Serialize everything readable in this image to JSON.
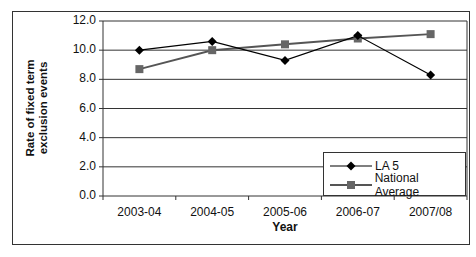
{
  "chart_data": {
    "type": "line",
    "title": "",
    "xlabel": "Year",
    "ylabel": "Rate of fixed term exclusion events",
    "ylabel_lines": [
      "Rate of fixed term",
      "exclusion events"
    ],
    "categories": [
      "2003-04",
      "2004-05",
      "2005-06",
      "2006-07",
      "2007/08"
    ],
    "series": [
      {
        "name": "LA 5",
        "marker": "diamond",
        "color": "#000000",
        "values": [
          10.0,
          10.6,
          9.3,
          11.0,
          8.3
        ]
      },
      {
        "name": "National Average",
        "marker": "square",
        "color": "#555555",
        "values": [
          8.7,
          10.0,
          10.4,
          10.8,
          11.1
        ]
      }
    ],
    "ylim": [
      0,
      12
    ],
    "yticks": [
      "0.0",
      "2.0",
      "4.0",
      "6.0",
      "8.0",
      "10.0",
      "12.0"
    ],
    "grid": true,
    "legend_position": "lower right, inside plot"
  }
}
